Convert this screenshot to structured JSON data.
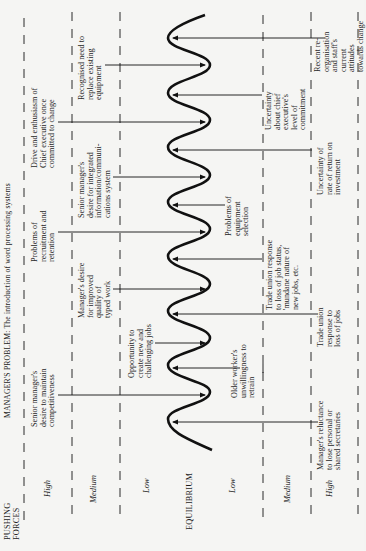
{
  "title": "MANAGER'S PROBLEM: The introduction of word processing systems",
  "axis_labels": {
    "pushing": "PUSHING\nFORCES",
    "equilibrium": "EQUILIBRIUM"
  },
  "levels": {
    "pushing_high": "High",
    "pushing_medium": "Medium",
    "pushing_low": "Low",
    "resisting_low": "Low",
    "resisting_medium": "Medium",
    "resisting_high": "High"
  },
  "pushing_forces": [
    {
      "label": "Senior manager's\ndesire to maintain\ncompetitiveness",
      "level": "High"
    },
    {
      "label": "Opportunity to\ncreate new and\nchallenging jobs",
      "level": "Low"
    },
    {
      "label": "Manager's desire\nfor improved\nquality of\ntyped work",
      "level": "Medium"
    },
    {
      "label": "Problems of\nrecruitment and\nretention",
      "level": "High"
    },
    {
      "label": "Senior manager's\ndesire for integrated\ninformation/communi-\ncations system",
      "level": "Medium"
    },
    {
      "label": "Drive and enthusiasm of\nChief executive once\ncommitted to change",
      "level": "High"
    },
    {
      "label": "Recognised need to\nreplace existing\nequipment",
      "level": "Medium"
    }
  ],
  "resisting_forces": [
    {
      "label": "Manager's reluctance\nto lose personal or\nshared secretaries",
      "level": "High"
    },
    {
      "label": "Older worker's\nunwillingness to\nretrain",
      "level": "Low"
    },
    {
      "label": "Trade union\nresponse to\nloss of jobs",
      "level": "High"
    },
    {
      "label": "Trade union response\nto loss of job status,\n'mundane nature of\nnew jobs, etc.",
      "level": "Medium"
    },
    {
      "label": "Problems of\nequipment\nselection",
      "level": "Low"
    },
    {
      "label": "Uncertainty of\nrate of return on\ninvestment",
      "level": "High"
    },
    {
      "label": "Uncertainty\nabout chief\nexecutive's\nlevel of\ncommitment",
      "level": "Medium"
    },
    {
      "label": "Recent re-\norganisation\nand staff's\ncurrent\nattitudes\ntowards change",
      "level": "High"
    }
  ]
}
